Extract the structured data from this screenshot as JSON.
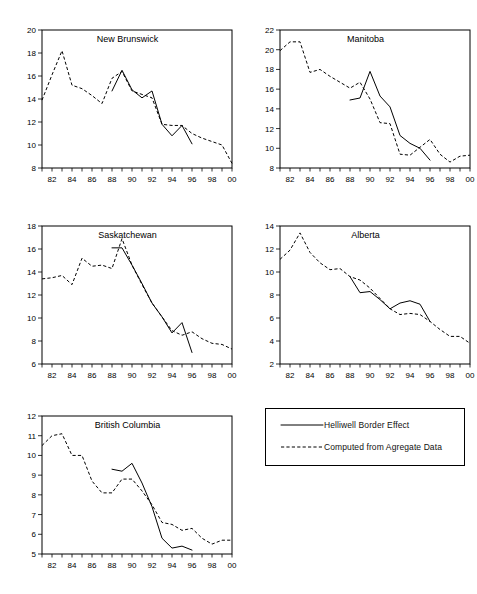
{
  "figure": {
    "width": 477,
    "height": 594,
    "background": "#ffffff",
    "ink_color": "#000000"
  },
  "legend": {
    "name": "series-legend",
    "entries": [
      {
        "label": "Helliwell Border Effect",
        "style": "solid"
      },
      {
        "label": "Computed from Agregate Data",
        "style": "dashed"
      }
    ]
  },
  "chart_data": [
    {
      "type": "line",
      "title": "New Brunswick",
      "xlabel": "",
      "ylabel": "",
      "grid": false,
      "legend_position": "external-panel",
      "xlim": [
        81,
        100
      ],
      "ylim": [
        8,
        20
      ],
      "yticks": [
        8,
        10,
        12,
        14,
        16,
        18,
        20
      ],
      "xticks": [
        82,
        84,
        86,
        88,
        90,
        92,
        94,
        96,
        98,
        100
      ],
      "xtick_labels": [
        "82",
        "84",
        "86",
        "88",
        "90",
        "92",
        "94",
        "96",
        "98",
        "00"
      ],
      "series": [
        {
          "name": "Computed from Agregate Data",
          "style": "dashed",
          "x": [
            81,
            82,
            83,
            84,
            85,
            86,
            87,
            88,
            89,
            90,
            91,
            92,
            93,
            94,
            95,
            96,
            97,
            98,
            99,
            100
          ],
          "values": [
            13.9,
            16.1,
            18.2,
            15.2,
            14.9,
            14.3,
            13.6,
            15.8,
            16.4,
            14.7,
            14.4,
            14.1,
            11.8,
            11.7,
            11.7,
            11.0,
            10.6,
            10.3,
            10.0,
            8.4
          ]
        },
        {
          "name": "Helliwell Border Effect",
          "style": "solid",
          "x": [
            88,
            89,
            90,
            91,
            92,
            93,
            94,
            95,
            96
          ],
          "values": [
            14.7,
            16.5,
            14.8,
            14.1,
            14.7,
            11.8,
            10.8,
            11.7,
            10.1
          ]
        }
      ]
    },
    {
      "type": "line",
      "title": "Manitoba",
      "xlabel": "",
      "ylabel": "",
      "grid": false,
      "legend_position": "external-panel",
      "xlim": [
        81,
        100
      ],
      "ylim": [
        8,
        22
      ],
      "yticks": [
        8,
        10,
        12,
        14,
        16,
        18,
        20,
        22
      ],
      "xticks": [
        82,
        84,
        86,
        88,
        90,
        92,
        94,
        96,
        98,
        100
      ],
      "xtick_labels": [
        "82",
        "84",
        "86",
        "88",
        "90",
        "92",
        "94",
        "96",
        "98",
        "00"
      ],
      "series": [
        {
          "name": "Computed from Agregate Data",
          "style": "dashed",
          "x": [
            81,
            82,
            83,
            84,
            85,
            86,
            87,
            88,
            89,
            90,
            91,
            92,
            93,
            94,
            95,
            96,
            97,
            98,
            99,
            100
          ],
          "values": [
            19.9,
            20.8,
            20.8,
            17.7,
            18.0,
            17.3,
            16.7,
            16.1,
            16.7,
            15.0,
            12.6,
            12.5,
            9.4,
            9.3,
            10.1,
            10.9,
            9.4,
            8.6,
            9.2,
            9.3
          ]
        },
        {
          "name": "Helliwell Border Effect",
          "style": "solid",
          "x": [
            88,
            89,
            90,
            91,
            92,
            93,
            94,
            95,
            96
          ],
          "values": [
            14.9,
            15.1,
            17.8,
            15.3,
            14.2,
            11.3,
            10.5,
            10.0,
            8.8
          ]
        }
      ]
    },
    {
      "type": "line",
      "title": "Saskatchewan",
      "xlabel": "",
      "ylabel": "",
      "grid": false,
      "legend_position": "external-panel",
      "xlim": [
        81,
        100
      ],
      "ylim": [
        6,
        18
      ],
      "yticks": [
        6,
        8,
        10,
        12,
        14,
        16,
        18
      ],
      "xticks": [
        82,
        84,
        86,
        88,
        90,
        92,
        94,
        96,
        98,
        100
      ],
      "xtick_labels": [
        "82",
        "84",
        "86",
        "88",
        "90",
        "92",
        "94",
        "96",
        "98",
        "00"
      ],
      "series": [
        {
          "name": "Computed from Agregate Data",
          "style": "dashed",
          "x": [
            81,
            82,
            83,
            84,
            85,
            86,
            87,
            88,
            89,
            90,
            91,
            92,
            93,
            94,
            95,
            96,
            97,
            98,
            99,
            100
          ],
          "values": [
            13.4,
            13.5,
            13.7,
            12.9,
            15.2,
            14.5,
            14.6,
            14.3,
            16.9,
            14.6,
            12.9,
            11.3,
            10.1,
            8.9,
            8.5,
            8.8,
            8.2,
            7.8,
            7.7,
            7.3
          ]
        },
        {
          "name": "Helliwell Border Effect",
          "style": "solid",
          "x": [
            88,
            89,
            90,
            91,
            92,
            93,
            94,
            95,
            96
          ],
          "values": [
            16.1,
            16.1,
            14.6,
            13.0,
            11.3,
            10.1,
            8.7,
            9.6,
            7.0
          ]
        }
      ]
    },
    {
      "type": "line",
      "title": "Alberta",
      "xlabel": "",
      "ylabel": "",
      "grid": false,
      "legend_position": "external-panel",
      "xlim": [
        81,
        100
      ],
      "ylim": [
        2,
        14
      ],
      "yticks": [
        2,
        4,
        6,
        8,
        10,
        12,
        14
      ],
      "xticks": [
        82,
        84,
        86,
        88,
        90,
        92,
        94,
        96,
        98,
        100
      ],
      "xtick_labels": [
        "82",
        "84",
        "86",
        "88",
        "90",
        "92",
        "94",
        "96",
        "98",
        "00"
      ],
      "series": [
        {
          "name": "Computed from Agregate Data",
          "style": "dashed",
          "x": [
            81,
            82,
            83,
            84,
            85,
            86,
            87,
            88,
            89,
            90,
            91,
            92,
            93,
            94,
            95,
            96,
            97,
            98,
            99,
            100
          ],
          "values": [
            11.1,
            11.9,
            13.4,
            11.7,
            10.8,
            10.2,
            10.3,
            9.6,
            9.3,
            8.6,
            7.7,
            6.8,
            6.3,
            6.4,
            6.3,
            5.7,
            5.0,
            4.4,
            4.4,
            3.8
          ]
        },
        {
          "name": "Helliwell Border Effect",
          "style": "solid",
          "x": [
            88,
            89,
            90,
            91,
            92,
            93,
            94,
            95,
            96
          ],
          "values": [
            9.6,
            8.2,
            8.3,
            7.6,
            6.8,
            7.3,
            7.5,
            7.2,
            5.7
          ]
        }
      ]
    },
    {
      "type": "line",
      "title": "British Columbia",
      "xlabel": "",
      "ylabel": "",
      "grid": false,
      "legend_position": "external-panel",
      "xlim": [
        81,
        100
      ],
      "ylim": [
        5,
        12
      ],
      "yticks": [
        5,
        6,
        7,
        8,
        9,
        10,
        11,
        12
      ],
      "xticks": [
        82,
        84,
        86,
        88,
        90,
        92,
        94,
        96,
        98,
        100
      ],
      "xtick_labels": [
        "82",
        "84",
        "86",
        "88",
        "90",
        "92",
        "94",
        "96",
        "98",
        "00"
      ],
      "series": [
        {
          "name": "Computed from Agregate Data",
          "style": "dashed",
          "x": [
            81,
            82,
            83,
            84,
            85,
            86,
            87,
            88,
            89,
            90,
            91,
            92,
            93,
            94,
            95,
            96,
            97,
            98,
            99,
            100
          ],
          "values": [
            10.5,
            11.0,
            11.1,
            10.0,
            10.0,
            8.7,
            8.1,
            8.1,
            8.8,
            8.8,
            8.2,
            7.5,
            6.6,
            6.5,
            6.2,
            6.3,
            5.8,
            5.5,
            5.7,
            5.7
          ]
        },
        {
          "name": "Helliwell Border Effect",
          "style": "solid",
          "x": [
            88,
            89,
            90,
            91,
            92,
            93,
            94,
            95,
            96
          ],
          "values": [
            9.3,
            9.2,
            9.6,
            8.6,
            7.4,
            5.8,
            5.3,
            5.4,
            5.2
          ]
        }
      ]
    }
  ]
}
